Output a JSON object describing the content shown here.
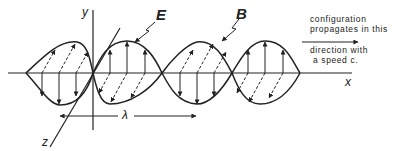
{
  "axes": {
    "x_label": "x",
    "y_label": "y",
    "z_label": "z"
  },
  "fields": {
    "electric_label": "E",
    "magnetic_label": "B"
  },
  "wavelength_label": "λ",
  "annotation": {
    "line1": "configuration",
    "line2": "propagates in this",
    "line3": "direction with",
    "line4": "a speed c."
  },
  "colors": {
    "ink": "#222222",
    "background": "#ffffff"
  }
}
